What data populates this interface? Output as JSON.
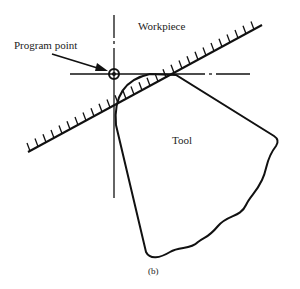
{
  "diagram": {
    "labels": {
      "program_point": "Program point",
      "workpiece": "Workpiece",
      "tool": "Tool",
      "caption": "(b)"
    },
    "colors": {
      "stroke": "#111111",
      "background": "#ffffff"
    }
  }
}
